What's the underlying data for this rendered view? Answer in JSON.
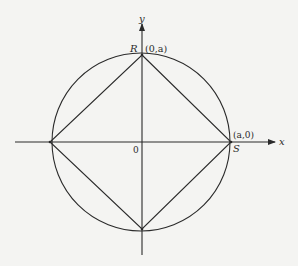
{
  "diagram": {
    "type": "geometry",
    "axes": {
      "x_label": "x",
      "y_label": "y",
      "origin_label": "0"
    },
    "points": {
      "R": {
        "label": "R",
        "coord_label": "(0,a)"
      },
      "S": {
        "label": "S",
        "coord_label": "(a,0)"
      }
    },
    "colors": {
      "ink": "#2a2a2a",
      "paper": "#f4f4f2"
    }
  }
}
